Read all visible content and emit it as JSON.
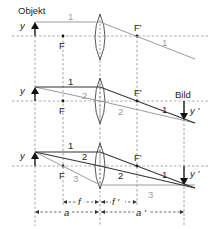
{
  "diagram": {
    "title_label": "Objekt",
    "image_label": "Bild",
    "object_symbol": "y",
    "image_symbol": "y '",
    "focus_front": "F",
    "focus_back": "F'",
    "panels": [
      {
        "id": "panel-1",
        "rays": [
          {
            "label": "1",
            "style": "light"
          },
          {
            "label": "1",
            "style": "light"
          }
        ]
      },
      {
        "id": "panel-2",
        "rays": [
          {
            "label": "1",
            "style": "dark"
          },
          {
            "label": "2",
            "style": "light"
          },
          {
            "label": "1",
            "style": "dark"
          },
          {
            "label": "2",
            "style": "light"
          }
        ]
      },
      {
        "id": "panel-3",
        "rays": [
          {
            "label": "1",
            "style": "dark"
          },
          {
            "label": "2",
            "style": "dark"
          },
          {
            "label": "3",
            "style": "light"
          },
          {
            "label": "1",
            "style": "dark"
          },
          {
            "label": "2",
            "style": "dark"
          },
          {
            "label": "3",
            "style": "light"
          }
        ]
      }
    ],
    "dimensions": {
      "f": "f",
      "f_prime": "f '",
      "a": "a",
      "a_prime": "a '"
    }
  },
  "labels": {
    "p1_ray1_in": "1",
    "p1_ray1_out": "1",
    "p2_ray1_in": "1",
    "p2_ray2_in": "2",
    "p2_ray1_out": "1",
    "p2_ray2_out": "2",
    "p3_ray1_in": "1",
    "p3_ray2_in": "2",
    "p3_ray3_in": "3",
    "p3_ray1_out": "1",
    "p3_ray2_out": "2",
    "p3_ray3_out": "3"
  }
}
